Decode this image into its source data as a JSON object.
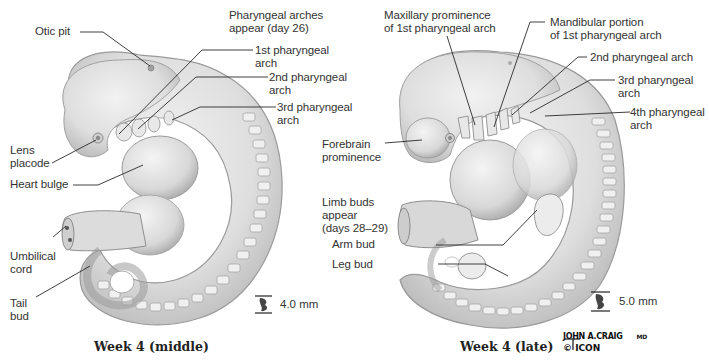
{
  "figure": {
    "panels": [
      {
        "caption": "Week 4 (middle)",
        "scale": "4.0 mm",
        "labels": {
          "otic_pit": "Otic pit",
          "arches_appear_1": "Pharyngeal arches",
          "arches_appear_2": "appear (day 26)",
          "arch1_1": "1st pharyngeal",
          "arch1_2": "arch",
          "arch2_1": "2nd pharyngeal",
          "arch2_2": "arch",
          "arch3_1": "3rd pharyngeal",
          "arch3_2": "arch",
          "lens_1": "Lens",
          "lens_2": "placode",
          "heart": "Heart bulge",
          "umbilical_1": "Umbilical",
          "umbilical_2": "cord",
          "tail_1": "Tail",
          "tail_2": "bud"
        }
      },
      {
        "caption": "Week 4 (late)",
        "scale": "5.0 mm",
        "labels": {
          "maxillary_1": "Maxillary prominence",
          "maxillary_2": "of 1st pharyngeal arch",
          "mandibular_1": "Mandibular portion",
          "mandibular_2": "of 1st pharyngeal arch",
          "arch2": "2nd pharyngeal arch",
          "arch3_1": "3rd pharyngeal",
          "arch3_2": "arch",
          "arch4_1": "4th pharyngeal",
          "arch4_2": "arch",
          "forebrain_1": "Forebrain",
          "forebrain_2": "prominence",
          "limb_1": "Limb buds",
          "limb_2": "appear",
          "limb_3": "(days 28–29)",
          "arm": "Arm bud",
          "leg": "Leg bud"
        }
      }
    ],
    "signature": {
      "artist": "JOHN A.CRAIG",
      "suffix": "MD",
      "copyright": "© ICON"
    },
    "colors": {
      "body_fill": "#e4e4e4",
      "body_shade": "#b8b8b8",
      "outline": "#9a9a9a",
      "leader": "#2a2a2a"
    }
  }
}
